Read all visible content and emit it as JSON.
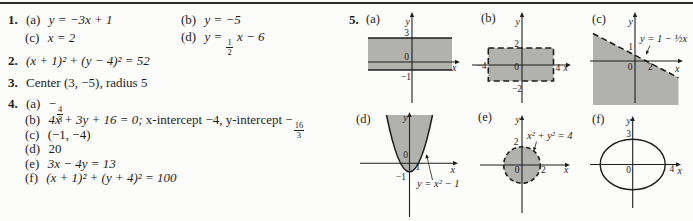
{
  "page": {
    "bg": "#fcfcfa",
    "rule_color": "#2a2a2a",
    "text_color": "#1e1e1e",
    "shade_color": "#b1b1ad"
  },
  "answers": {
    "item1": {
      "num": "1.",
      "a_label": "(a)",
      "a_eq": "y = −3x + 1",
      "b_label": "(b)",
      "b_eq": "y = −5",
      "c_label": "(c)",
      "c_eq": "x = 2",
      "d_label": "(d)",
      "d_pre": "y =",
      "d_frac_num": "1",
      "d_frac_den": "2",
      "d_post": "x − 6"
    },
    "item2": {
      "num": "2.",
      "eq": "(x + 1)² + (y − 4)² = 52"
    },
    "item3": {
      "num": "3.",
      "text": "Center (3, −5), radius 5"
    },
    "item4": {
      "num": "4.",
      "a_label": "(a)",
      "a_sign": "−",
      "a_frac_num": "4",
      "a_frac_den": "3",
      "b_label": "(b)",
      "b_eq": "4x + 3y + 16 = 0;",
      "b_mid": "x-intercept −4, y-intercept −",
      "b_frac_num": "16",
      "b_frac_den": "3",
      "c_label": "(c)",
      "c_val": "(−1, −4)",
      "d_label": "(d)",
      "d_val": "20",
      "e_label": "(e)",
      "e_eq": "3x − 4y = 13",
      "f_label": "(f)",
      "f_eq": "(x + 1)² + (y + 4)² = 100"
    }
  },
  "item5": {
    "num": "5.",
    "graphs": {
      "a": {
        "panel": "(a)",
        "y_label": "y",
        "x_label": "x",
        "tick_3": "3",
        "tick_0": "0",
        "tick_m1": "−1"
      },
      "b": {
        "panel": "(b)",
        "y_label": "y",
        "x_label": "x",
        "tick_2": "2",
        "tick_m4": "−4",
        "tick_0": "0",
        "tick_4": "4",
        "tick_m2": "−2"
      },
      "c": {
        "panel": "(c)",
        "y_label": "y",
        "x_label": "x",
        "equation": "y = 1 − ½x",
        "tick_1": "1",
        "tick_0": "0",
        "tick_2": "2"
      },
      "d": {
        "panel": "(d)",
        "y_label": "y",
        "x_label": "x",
        "equation": "y = x² − 1",
        "tick_0": "0",
        "tick_1": "1",
        "tick_m1": "−1"
      },
      "e": {
        "panel": "(e)",
        "y_label": "y",
        "x_label": "x",
        "equation": "x² + y² = 4",
        "tick_y2": "2",
        "tick_0": "0",
        "tick_x2": "2"
      },
      "f": {
        "panel": "(f)",
        "y_label": "y",
        "x_label": "x",
        "tick_3": "3",
        "tick_0": "0",
        "tick_4": "4"
      }
    }
  }
}
